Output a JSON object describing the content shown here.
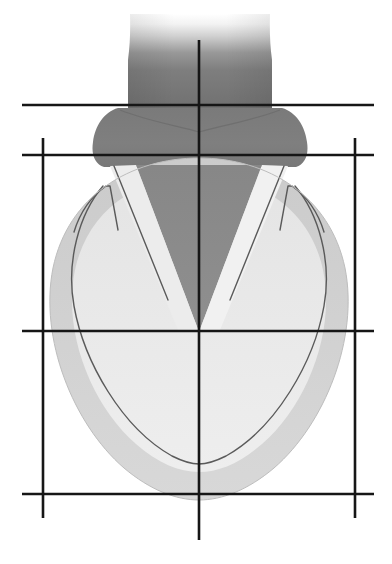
{
  "figure": {
    "canvas": {
      "width": 392,
      "height": 564,
      "background": "#ffffff"
    },
    "palette": {
      "background": "#ffffff",
      "great_vessel_dark": "#6f6f6f",
      "atrial_mass": "#7c7c7c",
      "septum_dark": "#8a8a8a",
      "myocardium_outer": "#cfcfcf",
      "chamber_light": "#e6e6e6",
      "chamber_lighter": "#efefef",
      "contour_line": "#5a5a5a",
      "grid_line": "#161616"
    },
    "regions": [
      {
        "name": "great-vessel-stem",
        "label": "Great vessel / outflow stem",
        "fill": "#6f6f6f",
        "gradient": "fades to white toward the top",
        "top": 14,
        "bottom": 112
      },
      {
        "name": "atrial-mass",
        "label": "Atrial mass",
        "fill": "#7c7c7c",
        "left": 93,
        "right": 305,
        "top": 100,
        "bottom": 166
      },
      {
        "name": "ventricular-myocardium",
        "label": "Ventricular myocardium (outer wall)",
        "fill": "#cfcfcf",
        "left": 45,
        "right": 347,
        "top": 158,
        "bottom": 500
      },
      {
        "name": "interventricular-septum",
        "label": "Interventricular septum (dark V wedge)",
        "fill": "#8a8a8a",
        "apex_x": 199,
        "apex_y": 332
      },
      {
        "name": "left-chamber",
        "label": "Left chamber cavity",
        "fill": "#e6e6e6"
      },
      {
        "name": "right-chamber",
        "label": "Right chamber cavity",
        "fill": "#efefef"
      }
    ],
    "contours": [
      {
        "name": "endocardial-outline",
        "label": "Inner endocardial outline",
        "stroke": "#5a5a5a",
        "width": 1.4
      },
      {
        "name": "left-valve-leaflet",
        "label": "Left valve leaflet hook",
        "stroke": "#5a5a5a",
        "width": 1.4
      },
      {
        "name": "right-valve-leaflet",
        "label": "Right valve leaflet hook",
        "stroke": "#5a5a5a",
        "width": 1.4
      },
      {
        "name": "left-septal-line",
        "label": "Left septal boundary line",
        "stroke": "#5a5a5a",
        "width": 1.4
      },
      {
        "name": "right-septal-line",
        "label": "Right septal boundary line",
        "stroke": "#5a5a5a",
        "width": 1.4
      }
    ],
    "grid": {
      "stroke": "#161616",
      "width": 2.6,
      "horizontal_lines": [
        {
          "name": "grid-line-h-top",
          "y": 105,
          "x1": 22,
          "x2": 374
        },
        {
          "name": "grid-line-h-upper",
          "y": 155,
          "x1": 22,
          "x2": 374
        },
        {
          "name": "grid-line-h-middle",
          "y": 331,
          "x1": 22,
          "x2": 374
        },
        {
          "name": "grid-line-h-bottom",
          "y": 494,
          "x1": 22,
          "x2": 374
        }
      ],
      "vertical_lines": [
        {
          "name": "grid-line-v-left",
          "x": 43,
          "y1": 138,
          "y2": 518
        },
        {
          "name": "grid-line-v-center",
          "x": 199,
          "y1": 40,
          "y2": 540
        },
        {
          "name": "grid-line-v-right",
          "x": 355,
          "y1": 138,
          "y2": 518
        }
      ]
    }
  }
}
